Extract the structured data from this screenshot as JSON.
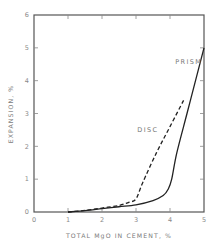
{
  "chart_data": {
    "type": "line",
    "title": "",
    "xlabel": "TOTAL MgO IN CEMENT, %",
    "ylabel": "EXPANSION, %",
    "xlim": [
      0,
      5
    ],
    "ylim": [
      0,
      6
    ],
    "xticks": [
      "0",
      "1",
      "2",
      "3",
      "4",
      "5"
    ],
    "yticks": [
      "0",
      "1",
      "2",
      "3",
      "4",
      "5",
      "6"
    ],
    "grid": false,
    "legend": "inline labels",
    "series": [
      {
        "name": "PRISM",
        "style": "solid",
        "x": [
          1.0,
          1.5,
          2.0,
          2.5,
          3.0,
          3.5,
          3.8,
          3.95,
          4.05,
          4.2,
          4.5,
          4.8,
          5.0
        ],
        "y": [
          0.0,
          0.04,
          0.1,
          0.16,
          0.22,
          0.35,
          0.5,
          0.7,
          1.0,
          1.8,
          3.0,
          4.2,
          5.0
        ]
      },
      {
        "name": "DISC",
        "style": "dashed",
        "x": [
          1.0,
          1.5,
          2.0,
          2.5,
          2.8,
          3.0,
          3.2,
          3.6,
          4.0,
          4.4
        ],
        "y": [
          0.0,
          0.05,
          0.12,
          0.2,
          0.3,
          0.4,
          0.9,
          1.8,
          2.6,
          3.4
        ]
      }
    ],
    "annotations": [
      {
        "text": "PRISM",
        "x": 4.55,
        "y": 4.5
      },
      {
        "text": "DISC",
        "x": 3.35,
        "y": 2.45
      }
    ]
  },
  "colors": {
    "axis": "#555555",
    "line": "#222222",
    "text": "#808080"
  }
}
